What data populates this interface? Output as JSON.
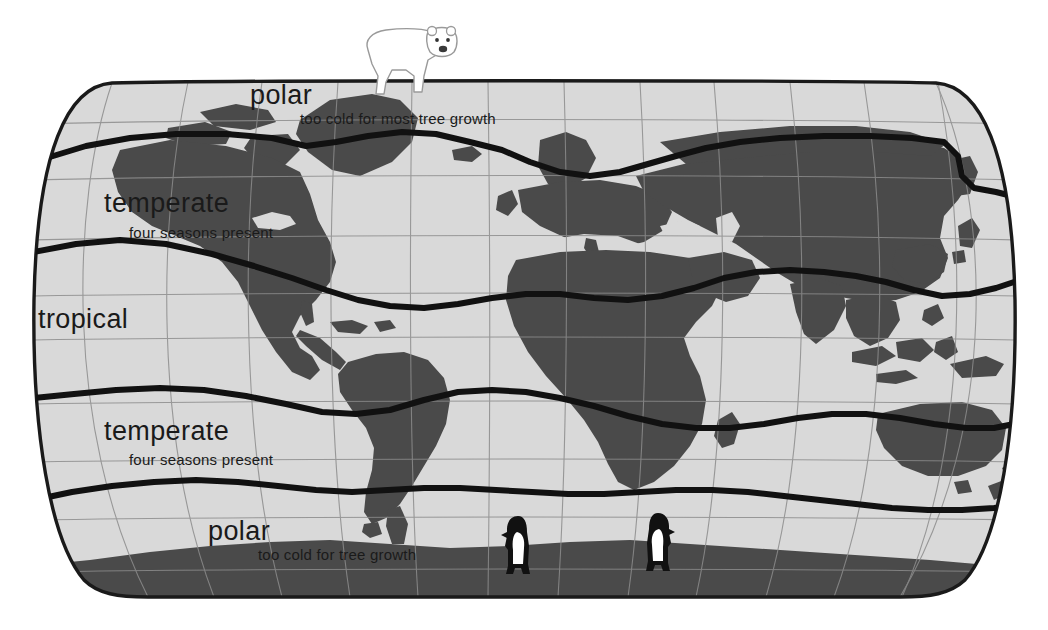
{
  "figure": {
    "kind": "world-climate-zone-map",
    "projection": "robinson-like oval world map",
    "width": 1048,
    "height": 630
  },
  "colors": {
    "background": "#ffffff",
    "ocean": "#d9d9d9",
    "land": "#4a4a4a",
    "graticule": "#8c8c8c",
    "map_outline": "#1a1a1a",
    "zone_boundary": "#111111",
    "label_text": "#1a1a1a",
    "animal_fill": "#ffffff",
    "animal_outline": "#9a9a9a",
    "penguin_dark": "#111111"
  },
  "zones": [
    {
      "id": "polar-north",
      "title": "polar",
      "subtitle": "too cold for most tree growth",
      "title_x": 250,
      "title_y": 104,
      "title_size": 27,
      "sub_x": 300,
      "sub_y": 124,
      "sub_size": 15
    },
    {
      "id": "temperate-north",
      "title": "temperate",
      "subtitle": "four seasons present",
      "title_x": 104,
      "title_y": 212,
      "title_size": 27,
      "sub_x": 129,
      "sub_y": 238,
      "sub_size": 15
    },
    {
      "id": "tropical",
      "title": "tropical",
      "subtitle": "",
      "title_x": 38,
      "title_y": 328,
      "title_size": 27,
      "sub_x": 0,
      "sub_y": 0,
      "sub_size": 15
    },
    {
      "id": "temperate-south",
      "title": "temperate",
      "subtitle": "four seasons present",
      "title_x": 104,
      "title_y": 440,
      "title_size": 27,
      "sub_x": 129,
      "sub_y": 465,
      "sub_size": 15
    },
    {
      "id": "polar-south",
      "title": "polar",
      "subtitle": "too cold for tree growth",
      "title_x": 208,
      "title_y": 540,
      "title_size": 27,
      "sub_x": 258,
      "sub_y": 560,
      "sub_size": 15
    }
  ],
  "animals": [
    {
      "id": "polar-bear",
      "name": "polar-bear",
      "label": "polar bear",
      "facing": "right",
      "x": 358,
      "y": 20,
      "width": 98,
      "height": 75
    },
    {
      "id": "penguin-left",
      "name": "penguin",
      "label": "penguin",
      "facing": "left",
      "x": 505,
      "y": 516,
      "width": 26,
      "height": 62
    },
    {
      "id": "penguin-right",
      "name": "penguin",
      "label": "penguin",
      "facing": "right",
      "x": 645,
      "y": 513,
      "width": 26,
      "height": 62
    }
  ],
  "graticule": {
    "parallels_count": 9,
    "meridians_count": 13,
    "visible": true
  },
  "boundary_lines": [
    {
      "id": "arctic-circle",
      "zone_above": "polar",
      "zone_below": "temperate"
    },
    {
      "id": "tropic-of-cancer",
      "zone_above": "temperate",
      "zone_below": "tropical"
    },
    {
      "id": "tropic-of-capricorn",
      "zone_above": "tropical",
      "zone_below": "temperate"
    },
    {
      "id": "antarctic-circle",
      "zone_above": "temperate",
      "zone_below": "polar"
    }
  ]
}
